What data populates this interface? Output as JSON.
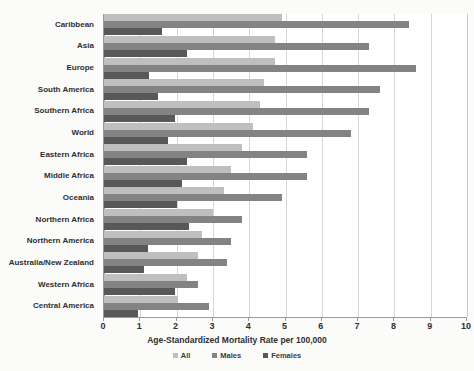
{
  "chart_data": {
    "type": "bar",
    "orientation": "horizontal",
    "title": "",
    "xlabel": "Age-Standardized Mortality Rate per 100,000",
    "ylabel": "",
    "xlim": [
      0,
      10
    ],
    "xticks": [
      "0",
      "1",
      "2",
      "3",
      "4",
      "5",
      "6",
      "7",
      "8",
      "9",
      "10"
    ],
    "grid": "vertical",
    "legend_position": "bottom",
    "categories": [
      "Caribbean",
      "Asia",
      "Europe",
      "South America",
      "Southern Africa",
      "World",
      "Eastern Africa",
      "Middle Africa",
      "Oceania",
      "Northern Africa",
      "Northern America",
      "Australia/New Zealand",
      "Western Africa",
      "Central America"
    ],
    "series": [
      {
        "name": "All",
        "color": "#bfbfbf",
        "values": [
          4.9,
          4.7,
          4.7,
          4.4,
          4.3,
          4.1,
          3.8,
          3.5,
          3.3,
          3.0,
          2.7,
          2.6,
          2.3,
          2.05
        ]
      },
      {
        "name": "Males",
        "color": "#838383",
        "values": [
          8.4,
          7.3,
          8.6,
          7.6,
          7.3,
          6.8,
          5.6,
          5.6,
          4.9,
          3.8,
          3.5,
          3.4,
          2.6,
          2.9
        ]
      },
      {
        "name": "Females",
        "color": "#585858",
        "values": [
          1.6,
          2.3,
          1.25,
          1.5,
          1.95,
          1.75,
          2.3,
          2.15,
          2.0,
          2.35,
          1.2,
          1.1,
          1.95,
          0.95
        ]
      }
    ]
  },
  "legend": {
    "items": [
      {
        "label": "All",
        "color": "#bfbfbf"
      },
      {
        "label": "Males",
        "color": "#838383"
      },
      {
        "label": "Females",
        "color": "#585858"
      }
    ]
  }
}
